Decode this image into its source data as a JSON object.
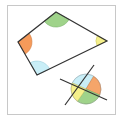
{
  "figure": {
    "frame": {
      "x": 7,
      "y": 5,
      "width": 109,
      "height": 110,
      "border_color": "#c8c8c8"
    },
    "quadrilateral": {
      "vertices": [
        [
          56,
          12
        ],
        [
          107,
          41
        ],
        [
          37,
          75
        ],
        [
          18,
          42
        ]
      ],
      "stroke": "#333333",
      "angles": [
        {
          "vertex": "top",
          "color": "#9fd38a"
        },
        {
          "vertex": "right",
          "color": "#f5f08a"
        },
        {
          "vertex": "bottom",
          "color": "#c9eef7"
        },
        {
          "vertex": "left",
          "color": "#f59a5a"
        }
      ]
    },
    "circle_figure": {
      "center": [
        86,
        89
      ],
      "radius": 15,
      "lines": [
        [
          [
            60,
            79
          ],
          [
            107,
            100
          ]
        ],
        [
          [
            65,
            105
          ],
          [
            94,
            65
          ]
        ]
      ],
      "sectors": [
        {
          "position": "top-left",
          "color": "#c9eef7"
        },
        {
          "position": "right",
          "color": "#f5a56a"
        },
        {
          "position": "bottom",
          "color": "#9fd38a"
        },
        {
          "position": "left",
          "color": "#f5f08a"
        }
      ]
    }
  }
}
